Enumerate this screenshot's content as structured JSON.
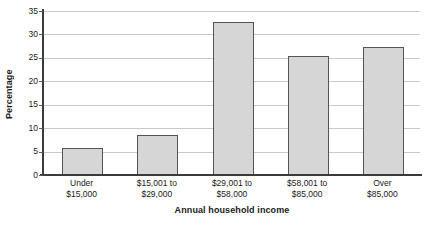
{
  "chart_data": {
    "type": "bar",
    "title": "",
    "xlabel": "Annual household income",
    "ylabel": "Percentage",
    "categories": [
      "Under\n$15,000",
      "$15,001 to\n$29,000",
      "$29,001 to\n$58,000",
      "$58,001 to\n$85,000",
      "Over\n$85,000"
    ],
    "category_lines": [
      [
        "Under",
        "$15,000"
      ],
      [
        "$15,001 to",
        "$29,000"
      ],
      [
        "$29,001 to",
        "$58,000"
      ],
      [
        "$58,001 to",
        "$85,000"
      ],
      [
        "Over",
        "$85,000"
      ]
    ],
    "values": [
      5.7,
      8.6,
      32.6,
      25.3,
      27.4
    ],
    "ylim": [
      0,
      35
    ],
    "ytick_labels": [
      "0",
      "5",
      "10",
      "15",
      "20",
      "25",
      "30",
      "35"
    ],
    "ytick_values": [
      0,
      5,
      10,
      15,
      20,
      25,
      30,
      35
    ],
    "grid": true,
    "legend": "none",
    "bar_fill_color": "#d6d6d6",
    "bar_edge_color": "#545454",
    "gridline_color": "#c9c9c9",
    "axis_color": "#3b3b3b",
    "background_color": "#ffffff"
  }
}
